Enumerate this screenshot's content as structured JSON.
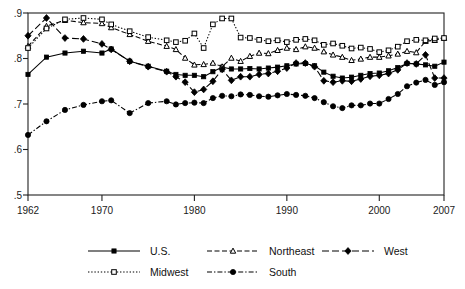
{
  "chart_data": {
    "type": "line",
    "title": "",
    "subtitle": "",
    "xlabel": "",
    "ylabel": "",
    "xlim": [
      1962,
      2007
    ],
    "ylim": [
      0.5,
      0.9
    ],
    "grid": false,
    "legend_position": "bottom",
    "y_ticks": [
      ".5",
      ".6",
      ".7",
      ".8",
      ".9"
    ],
    "y_tick_values": [
      0.5,
      0.6,
      0.7,
      0.8,
      0.9
    ],
    "x_ticks": [
      "1962",
      "1970",
      "1980",
      "1990",
      "2000",
      "2007"
    ],
    "x_tick_values": [
      1962,
      1970,
      1980,
      1990,
      2000,
      2007
    ],
    "series": [
      {
        "name": "U.S.",
        "marker": "filled-square",
        "line_style": "solid",
        "x": [
          1962,
          1964,
          1966,
          1968,
          1970,
          1971,
          1973,
          1975,
          1977,
          1978,
          1979,
          1980,
          1981,
          1982,
          1983,
          1984,
          1985,
          1986,
          1987,
          1988,
          1989,
          1990,
          1991,
          1992,
          1993,
          1994,
          1995,
          1996,
          1997,
          1998,
          1999,
          2000,
          2001,
          2002,
          2003,
          2004,
          2005,
          2006,
          2007
        ],
        "values": [
          0.765,
          0.803,
          0.812,
          0.816,
          0.812,
          0.821,
          0.794,
          0.783,
          0.772,
          0.765,
          0.763,
          0.763,
          0.76,
          0.771,
          0.781,
          0.777,
          0.777,
          0.778,
          0.777,
          0.779,
          0.781,
          0.784,
          0.788,
          0.789,
          0.784,
          0.77,
          0.761,
          0.757,
          0.759,
          0.763,
          0.767,
          0.768,
          0.773,
          0.78,
          0.789,
          0.788,
          0.786,
          0.783,
          0.792
        ]
      },
      {
        "name": "Northeast",
        "marker": "open-triangle",
        "line_style": "dashed",
        "x": [
          1962,
          1964,
          1966,
          1968,
          1970,
          1971,
          1973,
          1975,
          1977,
          1978,
          1979,
          1980,
          1981,
          1982,
          1983,
          1984,
          1985,
          1986,
          1987,
          1988,
          1989,
          1990,
          1991,
          1992,
          1993,
          1994,
          1995,
          1996,
          1997,
          1998,
          1999,
          2000,
          2001,
          2002,
          2003,
          2004,
          2005,
          2006,
          2007
        ],
        "values": [
          0.827,
          0.871,
          0.884,
          0.879,
          0.877,
          0.868,
          0.853,
          0.838,
          0.827,
          0.82,
          0.801,
          0.786,
          0.787,
          0.79,
          0.782,
          0.801,
          0.794,
          0.805,
          0.812,
          0.811,
          0.818,
          0.823,
          0.82,
          0.826,
          0.823,
          0.815,
          0.808,
          0.803,
          0.796,
          0.799,
          0.803,
          0.803,
          0.806,
          0.81,
          0.816,
          0.813,
          0.838,
          0.84,
          0.845
        ]
      },
      {
        "name": "Midwest",
        "marker": "open-square",
        "line_style": "dotted",
        "x": [
          1962,
          1964,
          1966,
          1968,
          1970,
          1971,
          1973,
          1975,
          1977,
          1978,
          1979,
          1980,
          1981,
          1982,
          1983,
          1984,
          1985,
          1986,
          1987,
          1988,
          1989,
          1990,
          1991,
          1992,
          1993,
          1994,
          1995,
          1996,
          1997,
          1998,
          1999,
          2000,
          2001,
          2002,
          2003,
          2004,
          2005,
          2006,
          2007
        ],
        "values": [
          0.823,
          0.866,
          0.886,
          0.889,
          0.886,
          0.875,
          0.86,
          0.847,
          0.84,
          0.836,
          0.839,
          0.855,
          0.823,
          0.875,
          0.888,
          0.888,
          0.846,
          0.845,
          0.841,
          0.838,
          0.84,
          0.836,
          0.841,
          0.843,
          0.84,
          0.83,
          0.833,
          0.828,
          0.822,
          0.824,
          0.821,
          0.814,
          0.818,
          0.826,
          0.838,
          0.841,
          0.84,
          0.844,
          0.845
        ]
      },
      {
        "name": "South",
        "marker": "filled-circle",
        "line_style": "dash-dot",
        "x": [
          1962,
          1964,
          1966,
          1968,
          1970,
          1971,
          1973,
          1975,
          1977,
          1978,
          1979,
          1980,
          1981,
          1982,
          1983,
          1984,
          1985,
          1986,
          1987,
          1988,
          1989,
          1990,
          1991,
          1992,
          1993,
          1994,
          1995,
          1996,
          1997,
          1998,
          1999,
          2000,
          2001,
          2002,
          2003,
          2004,
          2005,
          2006,
          2007
        ],
        "values": [
          0.632,
          0.662,
          0.687,
          0.698,
          0.706,
          0.708,
          0.68,
          0.702,
          0.706,
          0.699,
          0.702,
          0.703,
          0.702,
          0.713,
          0.718,
          0.717,
          0.721,
          0.72,
          0.717,
          0.716,
          0.719,
          0.722,
          0.72,
          0.718,
          0.713,
          0.704,
          0.695,
          0.691,
          0.697,
          0.697,
          0.701,
          0.701,
          0.711,
          0.722,
          0.739,
          0.747,
          0.753,
          0.742,
          0.748
        ]
      },
      {
        "name": "West",
        "marker": "filled-diamond",
        "line_style": "long-dash",
        "x": [
          1962,
          1964,
          1966,
          1968,
          1970,
          1971,
          1973,
          1975,
          1977,
          1978,
          1979,
          1980,
          1981,
          1982,
          1983,
          1984,
          1985,
          1986,
          1987,
          1988,
          1989,
          1990,
          1991,
          1992,
          1993,
          1994,
          1995,
          1996,
          1997,
          1998,
          1999,
          2000,
          2001,
          2002,
          2003,
          2004,
          2005,
          2006,
          2007
        ],
        "values": [
          0.85,
          0.889,
          0.845,
          0.843,
          0.832,
          0.82,
          0.794,
          0.782,
          0.771,
          0.76,
          0.748,
          0.726,
          0.732,
          0.75,
          0.776,
          0.752,
          0.76,
          0.76,
          0.765,
          0.767,
          0.772,
          0.779,
          0.79,
          0.79,
          0.782,
          0.751,
          0.748,
          0.751,
          0.75,
          0.755,
          0.761,
          0.763,
          0.767,
          0.775,
          0.79,
          0.788,
          0.808,
          0.757,
          0.757
        ]
      }
    ]
  },
  "legend": {
    "entries": [
      {
        "label": "U.S."
      },
      {
        "label": "Northeast"
      },
      {
        "label": "West"
      },
      {
        "label": "Midwest"
      },
      {
        "label": "South"
      }
    ]
  },
  "colors": {
    "ink": "#000000",
    "frame": "#222222",
    "background": "#ffffff"
  }
}
